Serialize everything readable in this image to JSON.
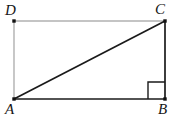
{
  "figure": {
    "name": "right-triangle-in-rectangle",
    "background_color": "#ffffff",
    "width": 179,
    "height": 124,
    "labels": {
      "a": "A",
      "b": "B",
      "c": "C",
      "d": "D"
    },
    "colors": {
      "dark_stroke": "#1a1a1a",
      "light_stroke": "#b0b0b0",
      "vertex_dot": "#111111",
      "label_text": "#161616"
    },
    "vertices": {
      "A": {
        "x": 14,
        "y": 99
      },
      "B": {
        "x": 165,
        "y": 99
      },
      "C": {
        "x": 165,
        "y": 21
      },
      "D": {
        "x": 14,
        "y": 21
      }
    },
    "segments": [
      {
        "name": "side-AB",
        "from": "A",
        "to": "B",
        "shade": "dark"
      },
      {
        "name": "side-BC",
        "from": "B",
        "to": "C",
        "shade": "dark"
      },
      {
        "name": "side-CD",
        "from": "C",
        "to": "D",
        "shade": "light"
      },
      {
        "name": "side-DA",
        "from": "D",
        "to": "A",
        "shade": "light"
      },
      {
        "name": "diagonal-AC",
        "from": "A",
        "to": "C",
        "shade": "dark"
      }
    ],
    "right_angle_marker": {
      "at_vertex": "B",
      "size": 17
    }
  }
}
